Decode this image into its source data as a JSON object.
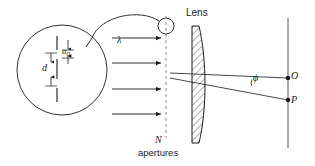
{
  "figure": {
    "background_color": "#ffffff",
    "stroke_color": "#1a1a1a",
    "width": 315,
    "height": 166
  },
  "labels": {
    "wavelength": "λ",
    "aperture_width": "a",
    "aperture_width_subscript": "0",
    "aperture_spacing": "d",
    "lens": "Lens",
    "angle": "ϕ",
    "focal_point_on_axis": "O",
    "focal_point_off_axis": "P",
    "aperture_count": "N",
    "aperture_count_unit": "apertures"
  },
  "elements": {
    "magnifier_circle": {
      "name": "magnified-inset-circle",
      "center_x": 62,
      "center_y": 70,
      "radius": 45
    },
    "callout_source_circle": {
      "name": "callout-source-circle",
      "center_x": 166,
      "center_y": 26,
      "radius": 8
    },
    "aperture_screen": {
      "name": "aperture-screen-dashed-line",
      "x": 166,
      "y_top": 18,
      "y_bottom": 138,
      "style": "dashed"
    },
    "incoming_wave_arrows": {
      "name": "plane-wave-arrows",
      "count": 4,
      "direction": "right",
      "y_positions": [
        38,
        63,
        88,
        113
      ],
      "x_start": 112,
      "x_end": 162
    },
    "lens": {
      "name": "plano-convex-lens",
      "x_flat": 192,
      "x_bulge": 206,
      "y_top": 26,
      "y_bottom": 143,
      "fill": "hatched"
    },
    "focal_plane": {
      "name": "focal-plane-line",
      "x": 288,
      "y_top": 18,
      "y_bottom": 148
    },
    "optical_axis_ray": {
      "name": "axis-ray-to-O",
      "from_x": 172,
      "from_y": 73,
      "to_x": 288,
      "to_y": 78
    },
    "tilted_ray": {
      "name": "tilted-ray-to-P",
      "from_x": 172,
      "from_y": 78,
      "to_x": 288,
      "to_y": 100
    }
  }
}
